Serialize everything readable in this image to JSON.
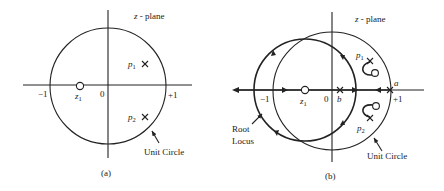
{
  "panel_a": {
    "plane_label": "z - plane",
    "pole1": "p",
    "pole1_sub": "1",
    "pole2": "p",
    "pole2_sub": "2",
    "zero": "z",
    "zero_sub": "1",
    "tick_neg1": "−1",
    "tick_pos1": "+1",
    "origin": "0",
    "unit_circle_label": "Unit Circle",
    "caption": "(a)"
  },
  "panel_b": {
    "plane_label": "z - plane",
    "pole1": "p",
    "pole1_sub": "1",
    "pole2": "p",
    "pole2_sub": "2",
    "zero": "z",
    "zero_sub": "1",
    "tick_neg1": "−1",
    "tick_pos1": "+1",
    "origin": "0",
    "point_a": "a",
    "point_b": "b",
    "root_locus_label_1": "Root",
    "root_locus_label_2": "Locus",
    "unit_circle_label": "Unit Circle",
    "caption": "(b)"
  },
  "colors": {
    "ink": "#222222",
    "background": "#ffffff"
  }
}
